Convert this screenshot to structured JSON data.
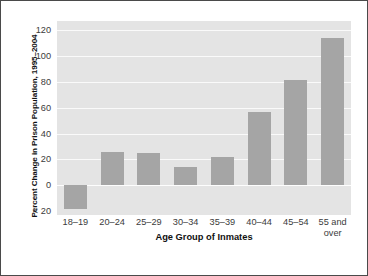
{
  "chart_data": {
    "type": "bar",
    "title": "",
    "xlabel": "Age Group of Inmates",
    "ylabel": "Percent Change in Prison Population, 1995–2004",
    "categories": [
      "18–19",
      "20–24",
      "25–29",
      "30–34",
      "35–39",
      "40–44",
      "45–54",
      "55 and\nover"
    ],
    "values": [
      -18,
      26,
      25,
      14,
      22,
      57,
      81,
      114
    ],
    "ylim": [
      -23,
      127
    ],
    "yticks": [
      {
        "value": 120,
        "label": "120"
      },
      {
        "value": 100,
        "label": "100"
      },
      {
        "value": 80,
        "label": "80"
      },
      {
        "value": 60,
        "label": "60"
      },
      {
        "value": 40,
        "label": "40"
      },
      {
        "value": 20,
        "label": "20"
      },
      {
        "value": 0,
        "label": "0"
      },
      {
        "value": -20,
        "label": "< 20"
      }
    ],
    "grid": true,
    "legend": "none",
    "colors": {
      "bar": "#a5a5a5",
      "plot_background": "#e4e4e4",
      "gridline": "#fafafa",
      "figure_background": "#ffffff",
      "border": "#4a4a4a",
      "tick_text": "#3b3b3b",
      "axis_title_text": "#111111"
    }
  }
}
